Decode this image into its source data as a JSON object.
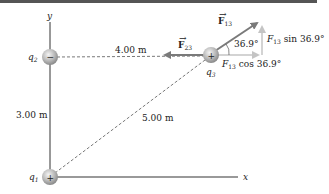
{
  "labels": {
    "y_axis": "y",
    "x_axis": "x",
    "q1": "q",
    "q1_sub": "1",
    "q2": "q",
    "q2_sub": "2",
    "q3": "q",
    "q3_sub": "3",
    "dist_q2_q3": "4.00 m",
    "dist_q1_q2": "3.00 m",
    "dist_q1_q3": "5.00 m",
    "angle": "36.9°",
    "F13": "F",
    "F13_sub": "13",
    "F23": "F",
    "F23_sub": "23",
    "F13_sin": "F",
    "F13_sin_sub": "13",
    "F13_sin_rest": " sin 36.9°",
    "F13_cos": "F",
    "F13_cos_sub": "13",
    "F13_cos_rest": " cos 36.9°"
  },
  "charges": {
    "q1_sign": "+",
    "q2_sign": "−",
    "q3_sign": "+"
  },
  "colors": {
    "axis": "#333333",
    "force": "#7a7a7a",
    "component": "#b0b0b0",
    "dashed": "#555555"
  }
}
